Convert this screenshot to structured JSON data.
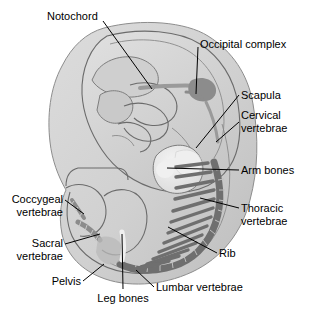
{
  "figure": {
    "background_color": "#ffffff",
    "body_fill": "#d4d4d4",
    "body_inner_fill": "#c6c6c6",
    "bone_dark_color": "#6f6f6f",
    "bone_light_color": "#efefef",
    "outline_color": "#6b6b6b",
    "label_color": "#000000",
    "leader_color": "#000000"
  },
  "labels": [
    {
      "id": "notochord",
      "text": "Notochord",
      "align": "start",
      "x": 47,
      "y": 16,
      "structure": "notochord",
      "structure_color": "#9a9a9a"
    },
    {
      "id": "occipital-complex",
      "text": "Occipital complex",
      "align": "start",
      "x": 200,
      "y": 44,
      "structure": "occipital complex",
      "structure_color": "#8c8c8c"
    },
    {
      "id": "scapula",
      "text": "Scapula",
      "align": "start",
      "x": 241,
      "y": 98,
      "structure": "scapula",
      "structure_color": "#efefef"
    },
    {
      "id": "cervical-vertebrae",
      "line1": "Cervical",
      "line2": "vertebrae",
      "align": "start",
      "x": 241,
      "y": 122,
      "structure": "cervical vertebrae",
      "structure_color": "#9a9a9a"
    },
    {
      "id": "arm-bones",
      "text": "Arm bones",
      "align": "start",
      "x": 241,
      "y": 173,
      "structure": "arm bones",
      "structure_color": "#efefef"
    },
    {
      "id": "thoracic-vertebrae",
      "line1": "Thoracic",
      "line2": "vertebrae",
      "align": "start",
      "x": 241,
      "y": 212,
      "structure": "thoracic vertebrae",
      "structure_color": "#6f6f6f"
    },
    {
      "id": "rib",
      "text": "Rib",
      "align": "start",
      "x": 219,
      "y": 256,
      "structure": "rib",
      "structure_color": "#6f6f6f"
    },
    {
      "id": "coccygeal-vertebrae",
      "line1": "Coccygeal",
      "line2": "vertebrae",
      "align": "end",
      "x": 63,
      "y": 203,
      "structure": "coccygeal vertebrae",
      "structure_color": "#8c8c8c"
    },
    {
      "id": "sacral-vertebrae",
      "line1": "Sacral",
      "line2": "vertebrae",
      "align": "end",
      "x": 63,
      "y": 247,
      "structure": "sacral vertebrae",
      "structure_color": "#8c8c8c"
    },
    {
      "id": "pelvis",
      "text": "Pelvis",
      "align": "end",
      "x": 81,
      "y": 285,
      "structure": "pelvis",
      "structure_color": "#b5b5b5"
    },
    {
      "id": "leg-bones",
      "text": "Leg bones",
      "align": "middle",
      "x": 123,
      "y": 300,
      "structure": "leg bones",
      "structure_color": "#efefef"
    },
    {
      "id": "lumbar-vertebrae",
      "text": "Lumbar vertebrae",
      "align": "start",
      "x": 156,
      "y": 291,
      "structure": "lumbar vertebrae",
      "structure_color": "#6f6f6f"
    }
  ]
}
